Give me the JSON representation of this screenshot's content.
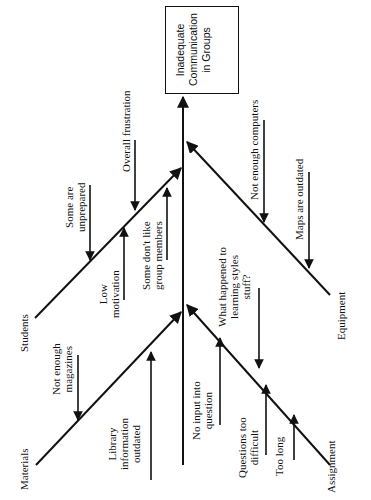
{
  "title": "Inadequate Communication in Groups",
  "effect": {
    "lines": [
      "Inadequate",
      "Communication",
      "in Groups"
    ]
  },
  "categories": {
    "students": {
      "label": "Students",
      "causes": [
        {
          "lines": [
            "Some are",
            "unprepared"
          ]
        },
        {
          "lines": [
            "Overall frustration"
          ]
        },
        {
          "lines": [
            "Low",
            "motivation"
          ]
        },
        {
          "lines": [
            "Some don't like",
            "group members"
          ]
        }
      ]
    },
    "materials": {
      "label": "Materials",
      "causes": [
        {
          "lines": [
            "Not enough",
            "magazines"
          ]
        },
        {
          "lines": [
            "Library",
            "information",
            "outdated"
          ]
        },
        {
          "lines": [
            "No input into",
            "question"
          ]
        }
      ]
    },
    "equipment": {
      "label": "Equipment",
      "causes": [
        {
          "lines": [
            "Not enough computers"
          ]
        },
        {
          "lines": [
            "Maps are outdated"
          ]
        }
      ]
    },
    "assignment": {
      "label": "Assignment",
      "causes": [
        {
          "lines": [
            "What happened to",
            "learning styles",
            "stuff?"
          ]
        },
        {
          "lines": [
            "Questions too",
            "difficult"
          ]
        },
        {
          "lines": [
            "Too long"
          ]
        }
      ]
    }
  },
  "colors": {
    "line": "#111111",
    "background": "#ffffff"
  }
}
